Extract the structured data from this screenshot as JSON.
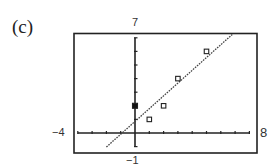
{
  "panel_label": "(c)",
  "window": {
    "xmin_label": "−4",
    "xmax_label": "8",
    "ymin_label": "−1",
    "ymax_label": "7"
  },
  "chart_data": {
    "type": "scatter",
    "title": "(c)",
    "xlabel": "",
    "ylabel": "",
    "xlim": [
      -4,
      8
    ],
    "ylim": [
      -1,
      7
    ],
    "grid": false,
    "x_ticks_every": 1,
    "y_ticks_every": 1,
    "series": [
      {
        "name": "data",
        "marker": "open-square",
        "points": [
          [
            1,
            1
          ],
          [
            2,
            2
          ],
          [
            3,
            4
          ],
          [
            5,
            6
          ]
        ]
      },
      {
        "name": "highlighted",
        "marker": "filled-square",
        "points": [
          [
            0,
            2
          ]
        ]
      },
      {
        "name": "regression line",
        "type": "line",
        "style": "dotted",
        "slope": 0.94,
        "intercept": 0.85,
        "x_range": [
          -2,
          6.8
        ]
      }
    ]
  }
}
